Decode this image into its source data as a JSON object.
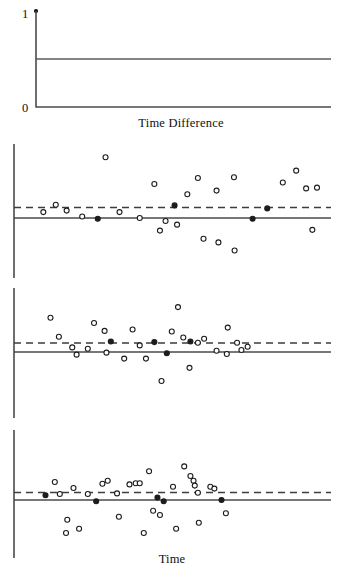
{
  "figure": {
    "background": "#ffffff",
    "ink": "#1c1c1c",
    "line_color": "#4a4a4a",
    "dash_color": "#3d3d3d",
    "width": 341,
    "height": 584
  },
  "top_panel": {
    "name": "time-difference-step-panel",
    "axis_label": "Time Difference",
    "y_ticks": [
      {
        "label": "1",
        "value": 1
      },
      {
        "label": "0",
        "value": 0
      }
    ],
    "axis_top_marker": "filled-dot",
    "step_level": 0.5,
    "x_range": [
      0,
      1
    ],
    "y_range": [
      0,
      1
    ]
  },
  "bottom_label": "Time",
  "panels": [
    {
      "name": "residual-panel-1",
      "zero_line": 0,
      "dashed_reference": 0.16,
      "x_range": [
        0,
        1
      ],
      "y_range": [
        -1,
        1
      ]
    },
    {
      "name": "residual-panel-2",
      "zero_line": 0,
      "dashed_reference": 0.14,
      "x_range": [
        0,
        1
      ],
      "y_range": [
        -1,
        1
      ]
    },
    {
      "name": "residual-panel-3",
      "zero_line": 0,
      "dashed_reference": 0.11,
      "x_range": [
        0,
        1
      ],
      "y_range": [
        -1,
        1
      ]
    }
  ],
  "chart_data": [
    {
      "type": "line",
      "title": "Time Difference",
      "xlabel": "Time Difference",
      "ylabel": "",
      "xlim": [
        0,
        1
      ],
      "ylim": [
        0,
        1
      ],
      "grid": false,
      "legend": "none",
      "ytick_labels": [
        "1",
        "0"
      ],
      "ytick_values": [
        1,
        0
      ],
      "series": [
        {
          "name": "step-level",
          "x": [
            0.0,
            1.0
          ],
          "y": [
            0.5,
            0.5
          ]
        }
      ],
      "annotations": [
        "filled dot at top of vertical axis (value 1)"
      ]
    },
    {
      "type": "scatter",
      "title": "",
      "xlabel": "",
      "ylabel": "",
      "xlim": [
        0,
        1
      ],
      "ylim": [
        -1,
        1
      ],
      "grid": false,
      "legend": "none",
      "reference_lines": [
        {
          "kind": "solid",
          "y": 0.0
        },
        {
          "kind": "dashed",
          "y": 0.16
        }
      ],
      "points": [
        {
          "x": 0.075,
          "y": 0.08,
          "filled": false
        },
        {
          "x": 0.115,
          "y": 0.18,
          "filled": false
        },
        {
          "x": 0.15,
          "y": 0.1,
          "filled": false
        },
        {
          "x": 0.2,
          "y": 0.02,
          "filled": false
        },
        {
          "x": 0.25,
          "y": -0.01,
          "filled": true
        },
        {
          "x": 0.275,
          "y": 0.82,
          "filled": false
        },
        {
          "x": 0.32,
          "y": 0.08,
          "filled": false
        },
        {
          "x": 0.385,
          "y": 0.0,
          "filled": false
        },
        {
          "x": 0.432,
          "y": 0.46,
          "filled": false
        },
        {
          "x": 0.45,
          "y": -0.17,
          "filled": false
        },
        {
          "x": 0.468,
          "y": -0.04,
          "filled": false
        },
        {
          "x": 0.505,
          "y": -0.09,
          "filled": false
        },
        {
          "x": 0.497,
          "y": 0.17,
          "filled": true
        },
        {
          "x": 0.538,
          "y": 0.32,
          "filled": false
        },
        {
          "x": 0.572,
          "y": 0.54,
          "filled": false
        },
        {
          "x": 0.59,
          "y": -0.28,
          "filled": false
        },
        {
          "x": 0.632,
          "y": 0.37,
          "filled": false
        },
        {
          "x": 0.638,
          "y": -0.33,
          "filled": false
        },
        {
          "x": 0.69,
          "y": -0.44,
          "filled": false
        },
        {
          "x": 0.688,
          "y": 0.55,
          "filled": false
        },
        {
          "x": 0.748,
          "y": -0.01,
          "filled": true
        },
        {
          "x": 0.795,
          "y": 0.13,
          "filled": true
        },
        {
          "x": 0.845,
          "y": 0.48,
          "filled": false
        },
        {
          "x": 0.888,
          "y": 0.64,
          "filled": false
        },
        {
          "x": 0.92,
          "y": 0.4,
          "filled": false
        },
        {
          "x": 0.955,
          "y": 0.41,
          "filled": false
        },
        {
          "x": 0.94,
          "y": -0.16,
          "filled": false
        }
      ]
    },
    {
      "type": "scatter",
      "title": "",
      "xlabel": "",
      "ylabel": "",
      "xlim": [
        0,
        1
      ],
      "ylim": [
        -1,
        1
      ],
      "grid": false,
      "legend": "none",
      "reference_lines": [
        {
          "kind": "solid",
          "y": 0.0
        },
        {
          "kind": "dashed",
          "y": 0.14
        }
      ],
      "points": [
        {
          "x": 0.098,
          "y": 0.52,
          "filled": false
        },
        {
          "x": 0.125,
          "y": 0.23,
          "filled": false
        },
        {
          "x": 0.168,
          "y": 0.07,
          "filled": false
        },
        {
          "x": 0.182,
          "y": -0.04,
          "filled": false
        },
        {
          "x": 0.218,
          "y": 0.05,
          "filled": false
        },
        {
          "x": 0.238,
          "y": 0.44,
          "filled": false
        },
        {
          "x": 0.272,
          "y": 0.32,
          "filled": false
        },
        {
          "x": 0.278,
          "y": -0.01,
          "filled": false
        },
        {
          "x": 0.292,
          "y": 0.16,
          "filled": true
        },
        {
          "x": 0.335,
          "y": -0.1,
          "filled": false
        },
        {
          "x": 0.362,
          "y": 0.34,
          "filled": false
        },
        {
          "x": 0.385,
          "y": 0.1,
          "filled": false
        },
        {
          "x": 0.405,
          "y": -0.1,
          "filled": false
        },
        {
          "x": 0.432,
          "y": 0.15,
          "filled": true
        },
        {
          "x": 0.455,
          "y": -0.44,
          "filled": false
        },
        {
          "x": 0.472,
          "y": -0.02,
          "filled": true
        },
        {
          "x": 0.488,
          "y": 0.31,
          "filled": false
        },
        {
          "x": 0.508,
          "y": 0.68,
          "filled": false
        },
        {
          "x": 0.525,
          "y": 0.22,
          "filled": false
        },
        {
          "x": 0.548,
          "y": 0.16,
          "filled": true
        },
        {
          "x": 0.545,
          "y": -0.24,
          "filled": false
        },
        {
          "x": 0.572,
          "y": 0.14,
          "filled": false
        },
        {
          "x": 0.592,
          "y": 0.2,
          "filled": false
        },
        {
          "x": 0.632,
          "y": 0.02,
          "filled": false
        },
        {
          "x": 0.668,
          "y": 0.37,
          "filled": false
        },
        {
          "x": 0.665,
          "y": -0.03,
          "filled": false
        },
        {
          "x": 0.698,
          "y": 0.14,
          "filled": false
        },
        {
          "x": 0.712,
          "y": 0.03,
          "filled": false
        },
        {
          "x": 0.732,
          "y": 0.08,
          "filled": false
        }
      ]
    },
    {
      "type": "scatter",
      "title": "",
      "xlabel": "Time",
      "ylabel": "",
      "xlim": [
        0,
        1
      ],
      "ylim": [
        -1,
        1
      ],
      "grid": false,
      "legend": "none",
      "reference_lines": [
        {
          "kind": "solid",
          "y": 0.0
        },
        {
          "kind": "dashed",
          "y": 0.11
        }
      ],
      "points": [
        {
          "x": 0.082,
          "y": 0.08,
          "filled": true
        },
        {
          "x": 0.112,
          "y": 0.3,
          "filled": false
        },
        {
          "x": 0.128,
          "y": 0.1,
          "filled": false
        },
        {
          "x": 0.152,
          "y": -0.33,
          "filled": false
        },
        {
          "x": 0.148,
          "y": -0.55,
          "filled": false
        },
        {
          "x": 0.172,
          "y": 0.2,
          "filled": false
        },
        {
          "x": 0.19,
          "y": -0.48,
          "filled": false
        },
        {
          "x": 0.218,
          "y": 0.1,
          "filled": false
        },
        {
          "x": 0.245,
          "y": -0.02,
          "filled": true
        },
        {
          "x": 0.265,
          "y": 0.27,
          "filled": false
        },
        {
          "x": 0.282,
          "y": 0.32,
          "filled": false
        },
        {
          "x": 0.312,
          "y": 0.11,
          "filled": false
        },
        {
          "x": 0.318,
          "y": -0.28,
          "filled": false
        },
        {
          "x": 0.352,
          "y": 0.26,
          "filled": false
        },
        {
          "x": 0.372,
          "y": 0.28,
          "filled": false
        },
        {
          "x": 0.385,
          "y": 0.28,
          "filled": false
        },
        {
          "x": 0.415,
          "y": 0.48,
          "filled": false
        },
        {
          "x": 0.398,
          "y": -0.55,
          "filled": false
        },
        {
          "x": 0.428,
          "y": -0.18,
          "filled": false
        },
        {
          "x": 0.442,
          "y": 0.04,
          "filled": true
        },
        {
          "x": 0.45,
          "y": -0.25,
          "filled": false
        },
        {
          "x": 0.462,
          "y": -0.02,
          "filled": true
        },
        {
          "x": 0.492,
          "y": 0.22,
          "filled": false
        },
        {
          "x": 0.502,
          "y": -0.48,
          "filled": false
        },
        {
          "x": 0.528,
          "y": 0.56,
          "filled": false
        },
        {
          "x": 0.548,
          "y": 0.4,
          "filled": false
        },
        {
          "x": 0.558,
          "y": 0.32,
          "filled": false
        },
        {
          "x": 0.562,
          "y": 0.24,
          "filled": false
        },
        {
          "x": 0.572,
          "y": 0.12,
          "filled": false
        },
        {
          "x": 0.575,
          "y": -0.38,
          "filled": false
        },
        {
          "x": 0.612,
          "y": 0.22,
          "filled": false
        },
        {
          "x": 0.625,
          "y": 0.19,
          "filled": false
        },
        {
          "x": 0.648,
          "y": 0.0,
          "filled": true
        },
        {
          "x": 0.662,
          "y": -0.22,
          "filled": false
        }
      ]
    }
  ]
}
